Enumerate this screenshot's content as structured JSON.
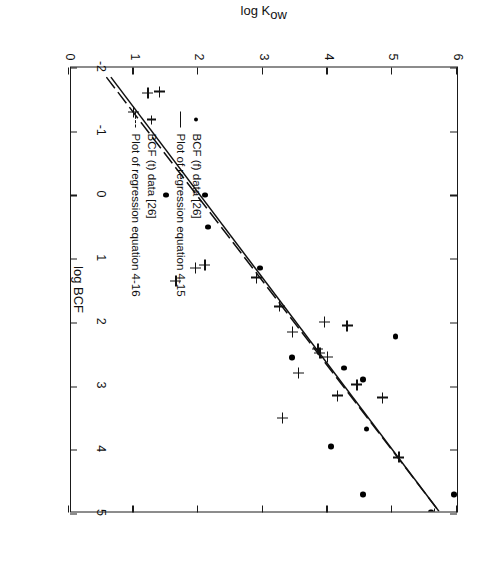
{
  "figure": {
    "ylabel": "log K",
    "ylabel_subscript": "ow",
    "xlabel": "log BCF"
  },
  "legend": {
    "items": [
      {
        "symbol": "dot-marker",
        "label": "BCF (f) data [26]"
      },
      {
        "symbol": "solid-line",
        "label": "Plot of regression equation 4-15"
      },
      {
        "symbol": "plus-marker",
        "label": "BCF (t) data [26]"
      },
      {
        "symbol": "dashed-line",
        "label": "Plot of regression equation 4-16"
      }
    ]
  },
  "chart_data": {
    "type": "scatter",
    "title": "",
    "xlabel": "log BCF",
    "ylabel": "log Kow",
    "xlim": [
      -2,
      5
    ],
    "ylim": [
      0,
      6
    ],
    "xticks": [
      -2,
      -1,
      0,
      1,
      2,
      3,
      4,
      5
    ],
    "xticklabels": [
      "-2",
      "-1",
      "0",
      "1",
      "2",
      "3",
      "4",
      "5"
    ],
    "yticks": [
      0,
      1,
      2,
      3,
      4,
      5,
      6
    ],
    "yticklabels": [
      "0",
      "1",
      "2",
      "3",
      "4",
      "5",
      "6"
    ],
    "grid": false,
    "legend_position": "inside-lower-left",
    "series": [
      {
        "name": "BCF (f) data [26]",
        "marker": "dot",
        "points": [
          [
            4.98,
            5.6
          ],
          [
            4.7,
            5.95
          ],
          [
            4.7,
            4.55
          ],
          [
            3.95,
            4.05
          ],
          [
            3.67,
            4.6
          ],
          [
            2.9,
            4.55
          ],
          [
            2.72,
            4.25
          ],
          [
            2.55,
            3.45
          ],
          [
            2.22,
            5.05
          ],
          [
            1.15,
            2.95
          ],
          [
            0.5,
            2.15
          ],
          [
            0.0,
            2.1
          ],
          [
            0.0,
            1.5
          ]
        ]
      },
      {
        "name": "BCF (t) data [26]",
        "marker": "plus",
        "points": [
          [
            5.0,
            5.65
          ],
          [
            4.12,
            5.1
          ],
          [
            3.5,
            3.3
          ],
          [
            3.18,
            4.85
          ],
          [
            3.15,
            4.15
          ],
          [
            2.98,
            4.45
          ],
          [
            2.8,
            3.55
          ],
          [
            2.55,
            4.0
          ],
          [
            2.48,
            3.88
          ],
          [
            2.42,
            3.85
          ],
          [
            2.15,
            3.45
          ],
          [
            2.05,
            4.3
          ],
          [
            2.0,
            3.95
          ],
          [
            1.75,
            3.25
          ],
          [
            1.3,
            2.9
          ],
          [
            1.1,
            2.1
          ],
          [
            1.15,
            1.95
          ],
          [
            1.35,
            1.65
          ],
          [
            -1.3,
            1.0
          ],
          [
            -1.62,
            1.4
          ],
          [
            -1.6,
            1.22
          ]
        ]
      }
    ],
    "regression_lines": [
      {
        "name": "Plot of regression equation 4-15",
        "style": "solid",
        "from": [
          -1.85,
          0.62
        ],
        "to": [
          5.0,
          5.72
        ]
      },
      {
        "name": "Plot of regression equation 4-16",
        "style": "dashed",
        "from": [
          -1.85,
          0.55
        ],
        "to": [
          5.0,
          5.72
        ]
      }
    ]
  }
}
